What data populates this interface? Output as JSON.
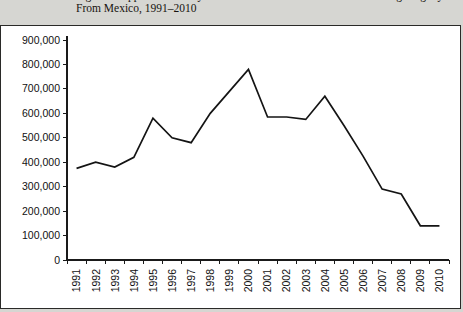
{
  "title": {
    "line1": "Figure 1. Apprehensions by the U.S. Border Patrol of Persons Entering Illegally",
    "line2": "From Mexico, 1991–2010"
  },
  "chart_data": {
    "type": "line",
    "title": "Apprehensions by the U.S. Border Patrol of Persons Entering Illegally From Mexico, 1991–2010",
    "xlabel": "",
    "ylabel": "",
    "categories": [
      "1991",
      "1992",
      "1993",
      "1994",
      "1995",
      "1996",
      "1997",
      "1998",
      "1999",
      "2000",
      "2001",
      "2002",
      "2003",
      "2004",
      "2005",
      "2006",
      "2007",
      "2008",
      "2009",
      "2010"
    ],
    "values": [
      375000,
      400000,
      380000,
      420000,
      580000,
      500000,
      480000,
      600000,
      690000,
      780000,
      585000,
      585000,
      575000,
      670000,
      550000,
      425000,
      290000,
      270000,
      140000,
      140000
    ],
    "series": [
      {
        "name": "Apprehensions",
        "values": [
          375000,
          400000,
          380000,
          420000,
          580000,
          500000,
          480000,
          600000,
          690000,
          780000,
          585000,
          585000,
          575000,
          670000,
          550000,
          425000,
          290000,
          270000,
          140000,
          140000
        ]
      }
    ],
    "ylim": [
      0,
      900000
    ],
    "ytick_values": [
      0,
      100000,
      200000,
      300000,
      400000,
      500000,
      600000,
      700000,
      800000,
      900000
    ],
    "ytick_labels": [
      "0",
      "100,000",
      "200,000",
      "300,000",
      "400,000",
      "500,000",
      "600,000",
      "700,000",
      "800,000",
      "900,000"
    ],
    "grid": false,
    "legend": false,
    "legend_position": "none",
    "line_color": "#141414",
    "background_color": "#ffffff"
  }
}
